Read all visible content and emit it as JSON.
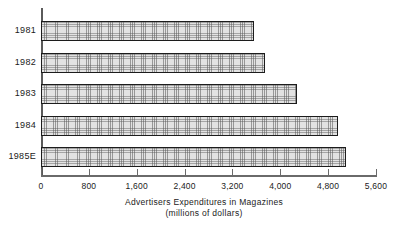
{
  "chart_data": {
    "type": "bar",
    "orientation": "horizontal",
    "title": "",
    "caption_line1": "Advertisers Expenditures in Magazines",
    "caption_line2": "(millions of dollars)",
    "xlabel": "Advertisers Expenditures in Magazines (millions of dollars)",
    "ylabel": "",
    "categories": [
      "1981",
      "1982",
      "1983",
      "1984",
      "1985E"
    ],
    "values": [
      3560,
      3745,
      4280,
      4970,
      5090
    ],
    "xlim": [
      0,
      5600
    ],
    "xticks": [
      0,
      800,
      1600,
      2400,
      3200,
      4000,
      4800,
      5600
    ],
    "xtick_labels": [
      "0",
      "800",
      "1,600",
      "2,400",
      "3,200",
      "4,000",
      "4,800",
      "5,600"
    ],
    "grid": false,
    "legend": null,
    "bar_fill": "#e2e2e2",
    "bar_edge": "#1c1c1c",
    "axis_color": "#6a6a6a"
  }
}
